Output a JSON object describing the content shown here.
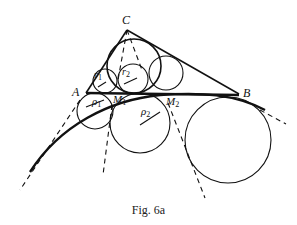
{
  "figure": {
    "caption": "Fig. 6a",
    "labels": {
      "C": "C",
      "A": "A",
      "B": "B",
      "M1": "M",
      "M1_sub": "1",
      "M2": "M",
      "M2_sub": "2",
      "r1": "r",
      "r1_sub": "1",
      "r2": "r",
      "r2_sub": "2",
      "rho1": "ρ",
      "rho1_sub": "1",
      "rho2": "ρ",
      "rho2_sub": "2"
    },
    "colors": {
      "ink": "#111111",
      "background": "#ffffff"
    }
  }
}
